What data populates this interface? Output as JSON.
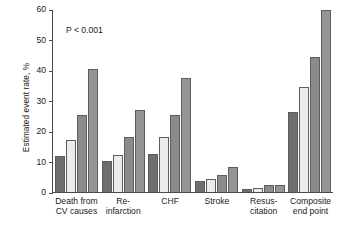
{
  "chart_data": {
    "type": "bar",
    "title": "",
    "xlabel": "",
    "ylabel": "Estimated event rate, %",
    "ylim": [
      0,
      60
    ],
    "yticks": [
      0,
      10,
      20,
      30,
      40,
      50,
      60
    ],
    "grid": false,
    "legend": "none",
    "annotations": [
      "P < 0.001"
    ],
    "categories": [
      "Death from\nCV causes",
      "Re-\ninfarction",
      "CHF",
      "Stroke",
      "Resus-\ncitation",
      "Composite\nend point"
    ],
    "series": [
      {
        "name": "series-1",
        "color": "#6e6e6e",
        "values": [
          11.7,
          10.3,
          12.5,
          3.5,
          0.9,
          26.2
        ]
      },
      {
        "name": "series-2",
        "color": "#ececec",
        "values": [
          17.2,
          12.3,
          17.9,
          4.2,
          1.3,
          34.3
        ]
      },
      {
        "name": "series-3",
        "color": "#8b8b8b",
        "values": [
          25.4,
          18.2,
          25.2,
          5.6,
          2.3,
          44.2
        ]
      },
      {
        "name": "series-4",
        "color": "#959595",
        "values": [
          40.2,
          27.0,
          37.3,
          8.1,
          2.3,
          59.8
        ]
      }
    ]
  }
}
